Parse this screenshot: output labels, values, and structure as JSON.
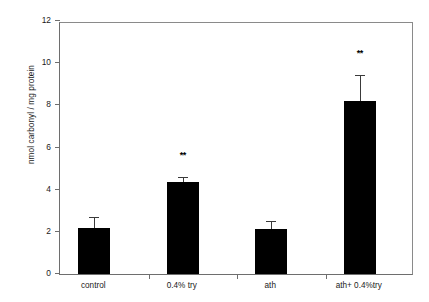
{
  "chart_data": {
    "type": "bar",
    "title": "",
    "xlabel": "",
    "ylabel": "nmol carbonyl / mg protein",
    "categories": [
      "control",
      "0.4% try",
      "ath",
      "ath+ 0.4%try"
    ],
    "values": [
      2.2,
      4.35,
      2.15,
      8.2
    ],
    "errors": [
      0.45,
      0.2,
      0.3,
      1.2
    ],
    "annotations": [
      "",
      "**",
      "",
      "**"
    ],
    "ylim": [
      0,
      12
    ],
    "yticks": [
      0,
      2,
      4,
      6,
      8,
      10,
      12
    ],
    "ytick_labels": [
      "0",
      "2",
      "4",
      "6",
      "8",
      "10",
      "12"
    ],
    "grid": false,
    "legend": false,
    "bar_color": "#000000",
    "error_color": "#3a3a3a",
    "axis_color": "#6e6e6e",
    "background": "#ffffff"
  }
}
